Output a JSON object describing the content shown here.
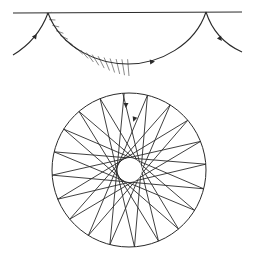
{
  "figure": {
    "colors": {
      "ink": "#2a2a2a",
      "hatch": "#6b6b6b",
      "background": "#ffffff"
    },
    "upper_panel": {
      "boundary": "flat surface line",
      "cusps": 2,
      "arrows": 3,
      "hatched_region": "caustic under the first arc"
    },
    "lower_panel": {
      "outer_boundary": "circle",
      "inner_caustic": "circle",
      "caustic_to_boundary_radius_ratio": 0.156,
      "reflection_count": 20,
      "arrows": 2
    }
  }
}
